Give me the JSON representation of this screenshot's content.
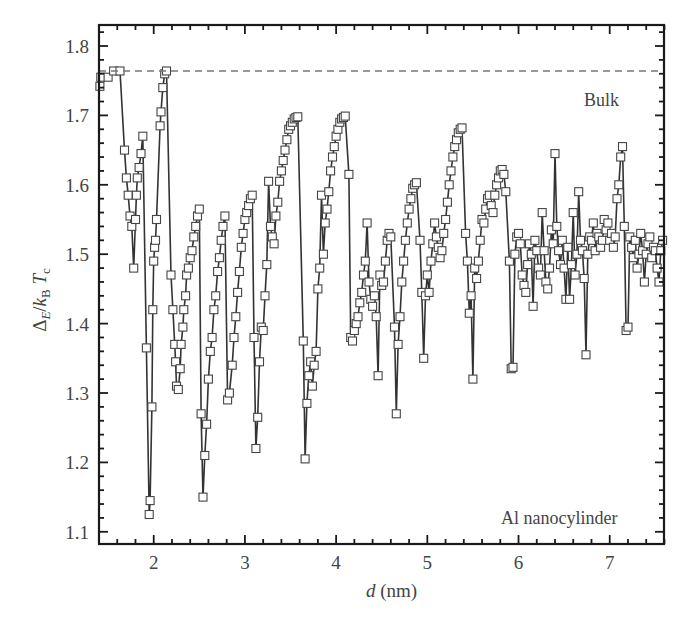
{
  "chart_data": {
    "type": "line",
    "title": "",
    "xlabel": "d (nm)",
    "ylabel": "Δ_E / k_B T_c",
    "xlim": [
      1.4,
      7.6
    ],
    "ylim": [
      1.08,
      1.83
    ],
    "grid": false,
    "legend": null,
    "x_ticks": [
      "2",
      "3",
      "4",
      "5",
      "6",
      "7"
    ],
    "y_ticks": [
      "1.1",
      "1.2",
      "1.3",
      "1.4",
      "1.5",
      "1.6",
      "1.7",
      "1.8"
    ],
    "reference_line": {
      "label": "Bulk",
      "y": 1.764,
      "style": "dashed"
    },
    "annotations": [
      "Bulk",
      "Al nanocylinder"
    ],
    "series": [
      {
        "name": "Al nanocylinder",
        "marker": "open-square",
        "points": [
          [
            1.41,
            1.742
          ],
          [
            1.42,
            1.755
          ],
          [
            1.5,
            1.755
          ],
          [
            1.56,
            1.764
          ],
          [
            1.63,
            1.764
          ],
          [
            1.68,
            1.65
          ],
          [
            1.7,
            1.61
          ],
          [
            1.72,
            1.585
          ],
          [
            1.74,
            1.555
          ],
          [
            1.76,
            1.54
          ],
          [
            1.78,
            1.48
          ],
          [
            1.8,
            1.55
          ],
          [
            1.81,
            1.585
          ],
          [
            1.82,
            1.61
          ],
          [
            1.84,
            1.625
          ],
          [
            1.86,
            1.645
          ],
          [
            1.88,
            1.67
          ],
          [
            1.92,
            1.365
          ],
          [
            1.95,
            1.125
          ],
          [
            1.96,
            1.145
          ],
          [
            1.98,
            1.28
          ],
          [
            1.99,
            1.42
          ],
          [
            2.0,
            1.49
          ],
          [
            2.01,
            1.51
          ],
          [
            2.02,
            1.52
          ],
          [
            2.03,
            1.55
          ],
          [
            2.07,
            1.685
          ],
          [
            2.08,
            1.705
          ],
          [
            2.1,
            1.74
          ],
          [
            2.12,
            1.76
          ],
          [
            2.14,
            1.764
          ],
          [
            2.19,
            1.47
          ],
          [
            2.21,
            1.42
          ],
          [
            2.23,
            1.37
          ],
          [
            2.24,
            1.345
          ],
          [
            2.25,
            1.31
          ],
          [
            2.27,
            1.305
          ],
          [
            2.29,
            1.335
          ],
          [
            2.3,
            1.37
          ],
          [
            2.32,
            1.395
          ],
          [
            2.33,
            1.42
          ],
          [
            2.35,
            1.44
          ],
          [
            2.36,
            1.47
          ],
          [
            2.38,
            1.48
          ],
          [
            2.4,
            1.495
          ],
          [
            2.42,
            1.505
          ],
          [
            2.44,
            1.525
          ],
          [
            2.46,
            1.54
          ],
          [
            2.48,
            1.555
          ],
          [
            2.5,
            1.565
          ],
          [
            2.52,
            1.27
          ],
          [
            2.54,
            1.15
          ],
          [
            2.56,
            1.21
          ],
          [
            2.58,
            1.255
          ],
          [
            2.6,
            1.32
          ],
          [
            2.62,
            1.36
          ],
          [
            2.64,
            1.38
          ],
          [
            2.66,
            1.42
          ],
          [
            2.68,
            1.44
          ],
          [
            2.7,
            1.475
          ],
          [
            2.72,
            1.495
          ],
          [
            2.74,
            1.52
          ],
          [
            2.76,
            1.54
          ],
          [
            2.78,
            1.555
          ],
          [
            2.81,
            1.29
          ],
          [
            2.83,
            1.3
          ],
          [
            2.86,
            1.34
          ],
          [
            2.88,
            1.38
          ],
          [
            2.9,
            1.41
          ],
          [
            2.92,
            1.445
          ],
          [
            2.94,
            1.475
          ],
          [
            2.96,
            1.51
          ],
          [
            2.98,
            1.53
          ],
          [
            3.0,
            1.55
          ],
          [
            3.02,
            1.56
          ],
          [
            3.04,
            1.57
          ],
          [
            3.06,
            1.58
          ],
          [
            3.08,
            1.585
          ],
          [
            3.1,
            1.38
          ],
          [
            3.12,
            1.22
          ],
          [
            3.14,
            1.265
          ],
          [
            3.16,
            1.345
          ],
          [
            3.18,
            1.395
          ],
          [
            3.2,
            1.39
          ],
          [
            3.22,
            1.44
          ],
          [
            3.24,
            1.485
          ],
          [
            3.26,
            1.605
          ],
          [
            3.28,
            1.54
          ],
          [
            3.3,
            1.525
          ],
          [
            3.32,
            1.515
          ],
          [
            3.34,
            1.555
          ],
          [
            3.36,
            1.575
          ],
          [
            3.38,
            1.605
          ],
          [
            3.4,
            1.62
          ],
          [
            3.42,
            1.635
          ],
          [
            3.44,
            1.65
          ],
          [
            3.46,
            1.665
          ],
          [
            3.48,
            1.68
          ],
          [
            3.5,
            1.685
          ],
          [
            3.52,
            1.69
          ],
          [
            3.54,
            1.695
          ],
          [
            3.56,
            1.697
          ],
          [
            3.58,
            1.698
          ],
          [
            3.64,
            1.375
          ],
          [
            3.66,
            1.205
          ],
          [
            3.68,
            1.285
          ],
          [
            3.7,
            1.325
          ],
          [
            3.72,
            1.345
          ],
          [
            3.74,
            1.31
          ],
          [
            3.76,
            1.34
          ],
          [
            3.78,
            1.36
          ],
          [
            3.8,
            1.45
          ],
          [
            3.82,
            1.48
          ],
          [
            3.84,
            1.585
          ],
          [
            3.86,
            1.5
          ],
          [
            3.88,
            1.545
          ],
          [
            3.9,
            1.565
          ],
          [
            3.92,
            1.59
          ],
          [
            3.94,
            1.62
          ],
          [
            3.96,
            1.64
          ],
          [
            3.98,
            1.655
          ],
          [
            4.0,
            1.67
          ],
          [
            4.02,
            1.68
          ],
          [
            4.04,
            1.69
          ],
          [
            4.06,
            1.695
          ],
          [
            4.08,
            1.697
          ],
          [
            4.1,
            1.699
          ],
          [
            4.14,
            1.615
          ],
          [
            4.16,
            1.38
          ],
          [
            4.18,
            1.375
          ],
          [
            4.2,
            1.39
          ],
          [
            4.22,
            1.4
          ],
          [
            4.24,
            1.41
          ],
          [
            4.26,
            1.43
          ],
          [
            4.28,
            1.445
          ],
          [
            4.3,
            1.47
          ],
          [
            4.32,
            1.49
          ],
          [
            4.34,
            1.545
          ],
          [
            4.36,
            1.46
          ],
          [
            4.38,
            1.435
          ],
          [
            4.4,
            1.425
          ],
          [
            4.42,
            1.44
          ],
          [
            4.44,
            1.41
          ],
          [
            4.46,
            1.325
          ],
          [
            4.48,
            1.47
          ],
          [
            4.5,
            1.455
          ],
          [
            4.52,
            1.46
          ],
          [
            4.54,
            1.49
          ],
          [
            4.56,
            1.52
          ],
          [
            4.58,
            1.53
          ],
          [
            4.6,
            1.525
          ],
          [
            4.64,
            1.395
          ],
          [
            4.66,
            1.27
          ],
          [
            4.68,
            1.37
          ],
          [
            4.7,
            1.41
          ],
          [
            4.72,
            1.46
          ],
          [
            4.74,
            1.49
          ],
          [
            4.76,
            1.52
          ],
          [
            4.78,
            1.545
          ],
          [
            4.8,
            1.565
          ],
          [
            4.82,
            1.58
          ],
          [
            4.84,
            1.595
          ],
          [
            4.86,
            1.6
          ],
          [
            4.88,
            1.603
          ],
          [
            4.92,
            1.52
          ],
          [
            4.94,
            1.445
          ],
          [
            4.96,
            1.35
          ],
          [
            4.98,
            1.44
          ],
          [
            5.0,
            1.47
          ],
          [
            5.02,
            1.445
          ],
          [
            5.04,
            1.49
          ],
          [
            5.06,
            1.515
          ],
          [
            5.08,
            1.545
          ],
          [
            5.1,
            1.525
          ],
          [
            5.12,
            1.51
          ],
          [
            5.14,
            1.495
          ],
          [
            5.16,
            1.505
          ],
          [
            5.18,
            1.53
          ],
          [
            5.2,
            1.55
          ],
          [
            5.22,
            1.575
          ],
          [
            5.24,
            1.6
          ],
          [
            5.26,
            1.62
          ],
          [
            5.28,
            1.64
          ],
          [
            5.3,
            1.655
          ],
          [
            5.32,
            1.665
          ],
          [
            5.34,
            1.675
          ],
          [
            5.36,
            1.68
          ],
          [
            5.38,
            1.682
          ],
          [
            5.42,
            1.53
          ],
          [
            5.44,
            1.49
          ],
          [
            5.46,
            1.415
          ],
          [
            5.48,
            1.44
          ],
          [
            5.5,
            1.32
          ],
          [
            5.52,
            1.48
          ],
          [
            5.54,
            1.465
          ],
          [
            5.56,
            1.49
          ],
          [
            5.58,
            1.52
          ],
          [
            5.6,
            1.55
          ],
          [
            5.62,
            1.545
          ],
          [
            5.64,
            1.565
          ],
          [
            5.66,
            1.58
          ],
          [
            5.68,
            1.585
          ],
          [
            5.7,
            1.57
          ],
          [
            5.72,
            1.56
          ],
          [
            5.74,
            1.585
          ],
          [
            5.76,
            1.6
          ],
          [
            5.78,
            1.61
          ],
          [
            5.8,
            1.62
          ],
          [
            5.82,
            1.622
          ],
          [
            5.84,
            1.615
          ],
          [
            5.86,
            1.59
          ],
          [
            5.9,
            1.49
          ],
          [
            5.92,
            1.335
          ],
          [
            5.94,
            1.337
          ],
          [
            5.96,
            1.5
          ],
          [
            5.98,
            1.525
          ],
          [
            6.0,
            1.53
          ],
          [
            6.02,
            1.515
          ],
          [
            6.04,
            1.47
          ],
          [
            6.06,
            1.455
          ],
          [
            6.08,
            1.445
          ],
          [
            6.1,
            1.485
          ],
          [
            6.12,
            1.515
          ],
          [
            6.14,
            1.5
          ],
          [
            6.16,
            1.425
          ],
          [
            6.18,
            1.52
          ],
          [
            6.2,
            1.505
          ],
          [
            6.22,
            1.48
          ],
          [
            6.24,
            1.47
          ],
          [
            6.26,
            1.56
          ],
          [
            6.28,
            1.505
          ],
          [
            6.3,
            1.46
          ],
          [
            6.32,
            1.45
          ],
          [
            6.34,
            1.48
          ],
          [
            6.36,
            1.535
          ],
          [
            6.38,
            1.515
          ],
          [
            6.4,
            1.645
          ],
          [
            6.42,
            1.54
          ],
          [
            6.44,
            1.505
          ],
          [
            6.46,
            1.485
          ],
          [
            6.48,
            1.52
          ],
          [
            6.5,
            1.48
          ],
          [
            6.52,
            1.435
          ],
          [
            6.54,
            1.51
          ],
          [
            6.56,
            1.435
          ],
          [
            6.58,
            1.485
          ],
          [
            6.6,
            1.56
          ],
          [
            6.62,
            1.47
          ],
          [
            6.64,
            1.5
          ],
          [
            6.66,
            1.59
          ],
          [
            6.68,
            1.52
          ],
          [
            6.7,
            1.505
          ],
          [
            6.72,
            1.465
          ],
          [
            6.74,
            1.355
          ],
          [
            6.76,
            1.5
          ],
          [
            6.78,
            1.525
          ],
          [
            6.8,
            1.52
          ],
          [
            6.82,
            1.545
          ],
          [
            6.84,
            1.505
          ],
          [
            6.86,
            1.53
          ],
          [
            6.88,
            1.525
          ],
          [
            6.9,
            1.51
          ],
          [
            6.92,
            1.52
          ],
          [
            6.94,
            1.55
          ],
          [
            6.96,
            1.535
          ],
          [
            6.98,
            1.545
          ],
          [
            7.0,
            1.52
          ],
          [
            7.02,
            1.53
          ],
          [
            7.04,
            1.51
          ],
          [
            7.06,
            1.525
          ],
          [
            7.08,
            1.58
          ],
          [
            7.1,
            1.6
          ],
          [
            7.12,
            1.64
          ],
          [
            7.14,
            1.655
          ],
          [
            7.16,
            1.54
          ],
          [
            7.18,
            1.39
          ],
          [
            7.2,
            1.395
          ],
          [
            7.22,
            1.525
          ],
          [
            7.24,
            1.51
          ],
          [
            7.26,
            1.495
          ],
          [
            7.28,
            1.52
          ],
          [
            7.3,
            1.48
          ],
          [
            7.32,
            1.5
          ],
          [
            7.34,
            1.53
          ],
          [
            7.36,
            1.505
          ],
          [
            7.38,
            1.46
          ],
          [
            7.4,
            1.5
          ],
          [
            7.42,
            1.515
          ],
          [
            7.44,
            1.525
          ],
          [
            7.46,
            1.495
          ],
          [
            7.48,
            1.51
          ],
          [
            7.5,
            1.505
          ],
          [
            7.52,
            1.48
          ],
          [
            7.54,
            1.46
          ],
          [
            7.56,
            1.505
          ],
          [
            7.58,
            1.52
          ]
        ]
      }
    ]
  }
}
